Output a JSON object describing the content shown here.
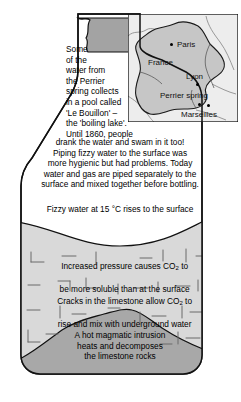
{
  "diagram": {
    "bottle": {
      "neck_label": "bottle-neck",
      "body_label": "bottle-body"
    },
    "annotations": {
      "intro_paragraph": "Some\nof the\nwater from\nthe Perrier\nspring collects\nin a pool called\n'Le Bouillon' –\nthe 'boiling lake'.\nUntil 1860, people",
      "intro_paragraph_cont": "drank the water and swam in it too!\nPiping fizzy water to the surface was\nmore hygienic but had problems. Today\nwater and gas are piped separately to the\nsurface and mixed together before bottling.",
      "surface_note": "Fizzy water at 15 °C rises to the surface",
      "pressure_note": "Increased pressure causes CO2 to\nbe more soluble than at the surface",
      "cracks_note": "Cracks in the limestone allow CO2 to\nrise and mix with underground water",
      "magma_note": "A hot magmatic intrusion\nheats and decomposes\nthe limestone rocks"
    },
    "chemical_formula": "CO2",
    "temperature": "15 °C"
  },
  "map": {
    "name": "france-inset-map",
    "country_label": "France",
    "cities": [
      {
        "name": "Paris",
        "label": "Paris"
      },
      {
        "name": "Lyon",
        "label": "Lyon"
      },
      {
        "name": "Perrier spring",
        "label": "Perrier spring"
      },
      {
        "name": "Marseilles",
        "label": "Marseilles"
      }
    ]
  },
  "colors": {
    "rock_light": "#d9d9d9",
    "rock_mid": "#cfcfcf",
    "magma": "#a8a8a8",
    "neck": "#a3a3a3",
    "map_land": "#c6c6c6",
    "map_sea": "#ededed",
    "outline": "#111111",
    "white": "#ffffff"
  }
}
